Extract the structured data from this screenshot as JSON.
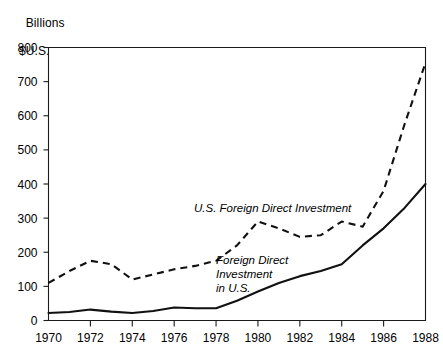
{
  "axis_title": {
    "line1": "Billions",
    "line2": "$U.S."
  },
  "chart_data": {
    "type": "line",
    "title": "",
    "subtitle": "",
    "xlabel": "",
    "ylabel": "Billions $U.S.",
    "xlim": [
      1970,
      1988
    ],
    "ylim": [
      0,
      800
    ],
    "grid": false,
    "legend_position": "inline-annotation",
    "x": [
      1970,
      1971,
      1972,
      1973,
      1974,
      1975,
      1976,
      1977,
      1978,
      1979,
      1980,
      1981,
      1982,
      1983,
      1984,
      1985,
      1986,
      1987,
      1988
    ],
    "y_ticks": [
      0,
      100,
      200,
      300,
      400,
      500,
      600,
      700,
      800
    ],
    "x_ticks": [
      1970,
      1972,
      1974,
      1976,
      1978,
      1980,
      1982,
      1984,
      1986,
      1988
    ],
    "x_tick_labels": [
      "1970",
      "1972",
      "1974",
      "1976",
      "1978",
      "1980",
      "1982",
      "1984",
      "1986",
      "1988"
    ],
    "y_tick_labels": [
      "0",
      "100",
      "200",
      "300",
      "400",
      "500",
      "600",
      "700",
      "800"
    ],
    "series": [
      {
        "name": "U.S. Foreign Direct Investment",
        "style": "dashed",
        "label_text_lines": [
          "U.S. Foreign Direct Investment"
        ],
        "values": [
          110,
          145,
          175,
          165,
          120,
          135,
          150,
          160,
          175,
          220,
          290,
          270,
          245,
          250,
          290,
          275,
          380,
          575,
          755
        ]
      },
      {
        "name": "Foreign Direct Investment in U.S.",
        "style": "solid",
        "label_text_lines": [
          "Foreign Direct",
          "Investment",
          "in U.S."
        ],
        "values": [
          22,
          25,
          32,
          26,
          22,
          28,
          38,
          36,
          36,
          58,
          85,
          110,
          130,
          145,
          165,
          220,
          270,
          330,
          400
        ]
      }
    ]
  },
  "annotations": {
    "upper_series_label": "U.S. Foreign Direct Investment",
    "lower_series_label_line1": "Foreign Direct",
    "lower_series_label_line2": "Investment",
    "lower_series_label_line3": "in U.S."
  },
  "colors": {
    "ink": "#111111",
    "background": "#ffffff"
  }
}
